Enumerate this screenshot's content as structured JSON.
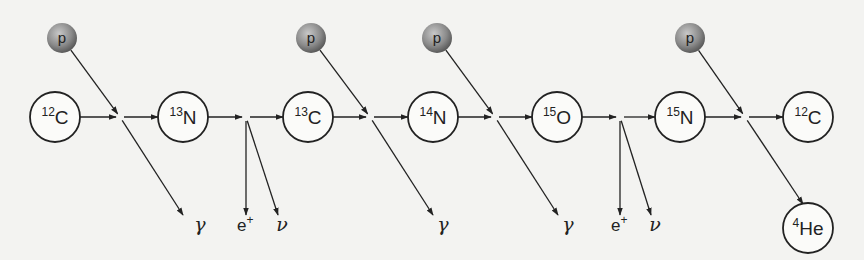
{
  "colors": {
    "line": "#222222",
    "background": "#f3f3f1",
    "proton_light": "#b5b5b5",
    "proton_dark": "#555555"
  },
  "protons": [
    {
      "label": "p",
      "x": 62,
      "y": 38,
      "target": 0
    },
    {
      "label": "p",
      "x": 311,
      "y": 38,
      "target": 2
    },
    {
      "label": "p",
      "x": 437,
      "y": 38,
      "target": 3
    },
    {
      "label": "p",
      "x": 690,
      "y": 38,
      "target": 5
    }
  ],
  "nuclei": [
    {
      "mass": "12",
      "symbol": "C",
      "x": 55,
      "y": 117
    },
    {
      "mass": "13",
      "symbol": "N",
      "x": 183,
      "y": 117
    },
    {
      "mass": "13",
      "symbol": "C",
      "x": 308,
      "y": 117
    },
    {
      "mass": "14",
      "symbol": "N",
      "x": 433,
      "y": 117
    },
    {
      "mass": "15",
      "symbol": "O",
      "x": 557,
      "y": 117
    },
    {
      "mass": "15",
      "symbol": "N",
      "x": 680,
      "y": 117
    },
    {
      "mass": "12",
      "symbol": "C",
      "x": 808,
      "y": 117
    },
    {
      "mass": "4",
      "symbol": "He",
      "x": 808,
      "y": 228
    }
  ],
  "junctions": [
    {
      "x": 120,
      "y": 117,
      "type": "proton-capture",
      "products": [
        {
          "label": "γ",
          "kind": "gamma",
          "x": 183,
          "y": 215
        }
      ]
    },
    {
      "x": 246,
      "y": 117,
      "type": "beta-decay",
      "products": [
        {
          "label": "e⁺",
          "kind": "positron",
          "x": 246,
          "y": 215
        },
        {
          "label": "ν",
          "kind": "neutrino",
          "x": 278,
          "y": 215
        }
      ]
    },
    {
      "x": 370,
      "y": 117,
      "type": "proton-capture",
      "products": [
        {
          "label": "γ",
          "kind": "gamma",
          "x": 433,
          "y": 215
        }
      ]
    },
    {
      "x": 495,
      "y": 117,
      "type": "proton-capture",
      "products": [
        {
          "label": "γ",
          "kind": "gamma",
          "x": 558,
          "y": 215
        }
      ]
    },
    {
      "x": 620,
      "y": 117,
      "type": "beta-decay",
      "products": [
        {
          "label": "e⁺",
          "kind": "positron",
          "x": 620,
          "y": 215
        },
        {
          "label": "ν",
          "kind": "neutrino",
          "x": 651,
          "y": 215
        }
      ]
    },
    {
      "x": 745,
      "y": 117,
      "type": "proton-capture-alpha",
      "products": [
        {
          "label": "⁴He",
          "kind": "alpha",
          "x": 803,
          "y": 204
        }
      ]
    }
  ],
  "labels": [
    {
      "text": "γ",
      "kind": "greek",
      "x": 200,
      "y": 231
    },
    {
      "text": "e",
      "sup": "+",
      "kind": "e",
      "x": 237,
      "y": 231
    },
    {
      "text": "ν",
      "kind": "greek",
      "x": 282,
      "y": 231
    },
    {
      "text": "γ",
      "kind": "greek",
      "x": 443,
      "y": 231
    },
    {
      "text": "γ",
      "kind": "greek",
      "x": 568,
      "y": 231
    },
    {
      "text": "e",
      "sup": "+",
      "kind": "e",
      "x": 611,
      "y": 231
    },
    {
      "text": "ν",
      "kind": "greek",
      "x": 655,
      "y": 231
    }
  ]
}
